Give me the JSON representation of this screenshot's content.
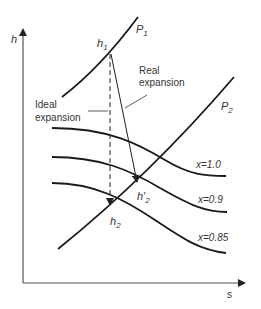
{
  "diagram": {
    "axes": {
      "y_label": "h",
      "x_label": "s"
    },
    "isobars": [
      {
        "name": "P",
        "sub": "1"
      },
      {
        "name": "P",
        "sub": "2"
      }
    ],
    "quality_lines": [
      {
        "label": "x=1.0"
      },
      {
        "label": "x=0.9"
      },
      {
        "label": "x=0.85"
      }
    ],
    "points": {
      "h1": {
        "name": "h",
        "sub": "1"
      },
      "h2": {
        "name": "h",
        "sub": "2"
      },
      "h2_prime": {
        "name": "h′",
        "sub": "2"
      }
    },
    "annotations": {
      "ideal_line1": "Ideal",
      "ideal_line2": "expansion",
      "real_line1": "Real",
      "real_line2": "expansion"
    },
    "colors": {
      "curve": "#1a1a1a",
      "axis": "#555555",
      "text": "#333333"
    }
  }
}
